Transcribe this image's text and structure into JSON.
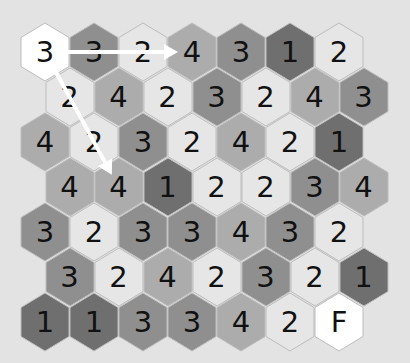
{
  "game": {
    "type": "hex-number-maze",
    "start_label": "3",
    "finish_label": "F"
  },
  "layout": {
    "origin_x": 45,
    "origin_y": 52,
    "col_step": 49,
    "row_step": 45,
    "odd_row_offset": 24.5
  },
  "colors": {
    "background": "#e3e3e3",
    "shade_1": "#6f6f6f",
    "shade_2": "#e6e6e6",
    "shade_3": "#8f8f8f",
    "shade_4": "#acacac",
    "start": "#ffffff",
    "finish": "#ffffff",
    "stroke": "#bdbdbd",
    "arrow": "#ffffff"
  },
  "grid": [
    [
      "3",
      "3",
      "2",
      "4",
      "3",
      "1",
      "2"
    ],
    [
      "2",
      "4",
      "2",
      "3",
      "2",
      "4",
      "3"
    ],
    [
      "4",
      "2",
      "3",
      "2",
      "4",
      "2",
      "1"
    ],
    [
      "4",
      "4",
      "1",
      "2",
      "2",
      "3",
      "4"
    ],
    [
      "3",
      "2",
      "3",
      "3",
      "4",
      "3",
      "2"
    ],
    [
      "3",
      "2",
      "4",
      "2",
      "3",
      "2",
      "1"
    ],
    [
      "1",
      "1",
      "3",
      "3",
      "4",
      "2",
      "F"
    ]
  ],
  "arrows": [
    {
      "from": [
        0,
        0
      ],
      "to": [
        0,
        3
      ],
      "label": "move-right-3"
    },
    {
      "from": [
        0,
        0
      ],
      "to": [
        3,
        1
      ],
      "label": "move-down-right-3"
    }
  ]
}
